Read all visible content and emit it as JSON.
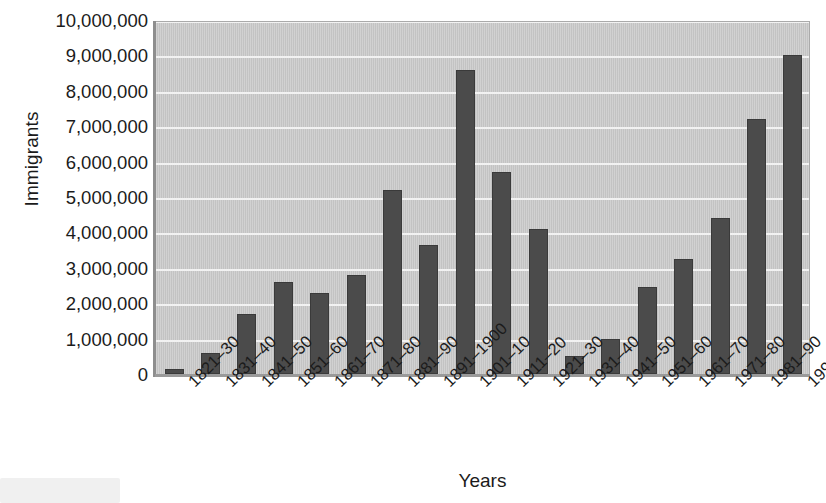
{
  "chart_data": {
    "type": "bar",
    "title": "",
    "xlabel": "Years",
    "ylabel": "Immigrants",
    "ylim": [
      0,
      10000000
    ],
    "grid": true,
    "legend": "none",
    "y_ticks": [
      "10,000,000",
      "9,000,000",
      "8,000,000",
      "7,000,000",
      "6,000,000",
      "5,000,000",
      "4,000,000",
      "3,000,000",
      "2,000,000",
      "1,000,000",
      "0"
    ],
    "y_tick_values": [
      10000000,
      9000000,
      8000000,
      7000000,
      6000000,
      5000000,
      4000000,
      3000000,
      2000000,
      1000000,
      0
    ],
    "categories": [
      "1821–30",
      "1831–40",
      "1841–50",
      "1851–60",
      "1861–70",
      "1871–80",
      "1881–90",
      "1891–1900",
      "1901–10",
      "1911–20",
      "1921–30",
      "1931–40",
      "1941–50",
      "1951–60",
      "1961–70",
      "1971–80",
      "1981–90",
      "1991–2000"
    ],
    "values": [
      150000,
      600000,
      1700000,
      2600000,
      2300000,
      2800000,
      5200000,
      3650000,
      8600000,
      5700000,
      4100000,
      520000,
      1000000,
      2450000,
      3250000,
      4400000,
      7200000,
      9000000
    ],
    "colors": {
      "bar": "#4b4b4b",
      "bar_border": "#3a3a3a",
      "plot_background": "#c9c9c9",
      "gridline": "#f2f2f2",
      "axis": "#9a9a9a",
      "text": "#1b1b1b",
      "page_background": "#ffffff"
    }
  }
}
